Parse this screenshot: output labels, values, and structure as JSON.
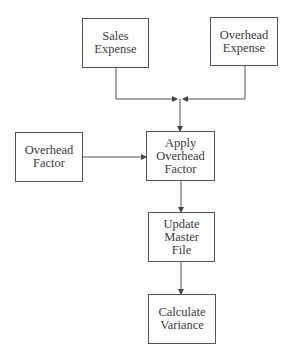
{
  "diagram": {
    "type": "flowchart",
    "nodes": [
      {
        "id": "sales-expense",
        "lines": [
          "Sales",
          "Expense"
        ]
      },
      {
        "id": "overhead-expense",
        "lines": [
          "Overhead",
          "Expense"
        ]
      },
      {
        "id": "overhead-factor",
        "lines": [
          "Overhead",
          "Factor"
        ]
      },
      {
        "id": "apply-overhead-factor",
        "lines": [
          "Apply",
          "Overhead",
          "Factor"
        ]
      },
      {
        "id": "update-master-file",
        "lines": [
          "Update",
          "Master",
          "File"
        ]
      },
      {
        "id": "calculate-variance",
        "lines": [
          "Calculate",
          "Variance"
        ]
      }
    ],
    "edges": [
      {
        "from": "sales-expense",
        "to": "apply-overhead-factor"
      },
      {
        "from": "overhead-expense",
        "to": "apply-overhead-factor"
      },
      {
        "from": "overhead-factor",
        "to": "apply-overhead-factor"
      },
      {
        "from": "apply-overhead-factor",
        "to": "update-master-file"
      },
      {
        "from": "update-master-file",
        "to": "calculate-variance"
      }
    ],
    "colors": {
      "line": "#555555",
      "text": "#3a3a3a",
      "background": "#ffffff"
    }
  }
}
